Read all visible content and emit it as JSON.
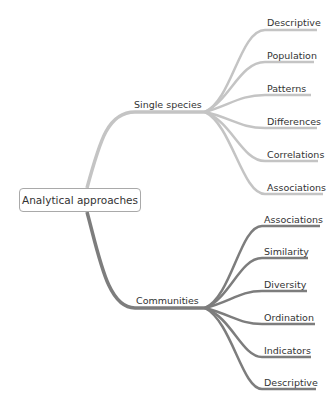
{
  "root": {
    "label": "Analytical approaches"
  },
  "branches": [
    {
      "label": "Single species",
      "color": "#c4c4c4",
      "children": [
        {
          "label": "Descriptive"
        },
        {
          "label": "Population"
        },
        {
          "label": "Patterns"
        },
        {
          "label": "Differences"
        },
        {
          "label": "Correlations"
        },
        {
          "label": "Associations"
        }
      ]
    },
    {
      "label": "Communities",
      "color": "#7d7d7d",
      "children": [
        {
          "label": "Associations"
        },
        {
          "label": "Similarity"
        },
        {
          "label": "Diversity"
        },
        {
          "label": "Ordination"
        },
        {
          "label": "Indicators"
        },
        {
          "label": "Descriptive"
        }
      ]
    }
  ]
}
